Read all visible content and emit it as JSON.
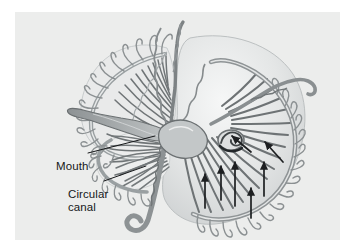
{
  "figure": {
    "panel": {
      "background_color": "#ecedec",
      "outer_background_color": "#ffffff",
      "x": 15,
      "y": 12,
      "width": 325,
      "height": 228
    },
    "style": {
      "line_color": "#6e7374",
      "dark_line_color": "#4a4f51",
      "fill_light": "#fdfdfd",
      "fill_mid": "#c9cccd",
      "fill_dark": "#9a9fa1",
      "bell_tint": "#dfe1e1",
      "arrow_color": "#1d1f21",
      "label_color": "#16181a",
      "leader_color": "#16181a"
    },
    "labels": [
      {
        "id": "mouth",
        "text": "Mouth",
        "lines": [
          "Mouth"
        ],
        "x": 41,
        "y": 148,
        "leader": {
          "from_x": 88,
          "from_y": 153,
          "to_x": 152,
          "to_y": 136
        }
      },
      {
        "id": "circular-canal",
        "text": "Circular canal",
        "lines": [
          "Circular",
          "canal"
        ],
        "x": 53,
        "y": 176,
        "leader": {
          "from_x": 104,
          "from_y": 181,
          "to_x": 145,
          "to_y": 167
        }
      }
    ],
    "structures": {
      "bell_lobes": 3,
      "radial_canal_count_upper_left": 17,
      "radial_canal_count_lower_right": 18,
      "radial_canal_count_middle_left": 12,
      "tentacle_count_upper_left": 14,
      "tentacle_count_lower_right": 16,
      "flow_arrow_count": 7
    },
    "flow_arrows": [
      {
        "x1": 206,
        "y1": 196,
        "x2": 206,
        "y2": 160,
        "dir": "up"
      },
      {
        "x1": 222,
        "y1": 190,
        "x2": 222,
        "y2": 156,
        "dir": "up"
      },
      {
        "x1": 236,
        "y1": 196,
        "x2": 236,
        "y2": 150,
        "dir": "up"
      },
      {
        "x1": 249,
        "y1": 208,
        "x2": 249,
        "y2": 178,
        "dir": "up"
      },
      {
        "x1": 263,
        "y1": 186,
        "x2": 263,
        "y2": 152,
        "dir": "up"
      },
      {
        "x1": 234,
        "y1": 138,
        "x2": 214,
        "y2": 124,
        "dir": "up-left"
      },
      {
        "x1": 268,
        "y1": 148,
        "x2": 249,
        "y2": 128,
        "dir": "up-left"
      }
    ]
  }
}
